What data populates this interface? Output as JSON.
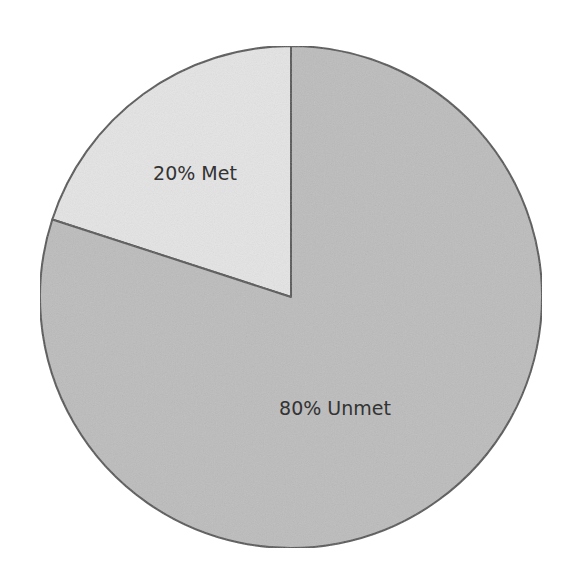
{
  "chart_data": {
    "type": "pie",
    "title": "",
    "categories": [
      "Met",
      "Unmet"
    ],
    "values": [
      20,
      80
    ],
    "labels": [
      "20% Met",
      "80% Unmet"
    ],
    "colors": [
      "#e4e4e4",
      "#bcbcbc"
    ],
    "start_angle_deg": 0,
    "direction": "clockwise_from_top",
    "legend": "none",
    "border_color": "#555555"
  }
}
